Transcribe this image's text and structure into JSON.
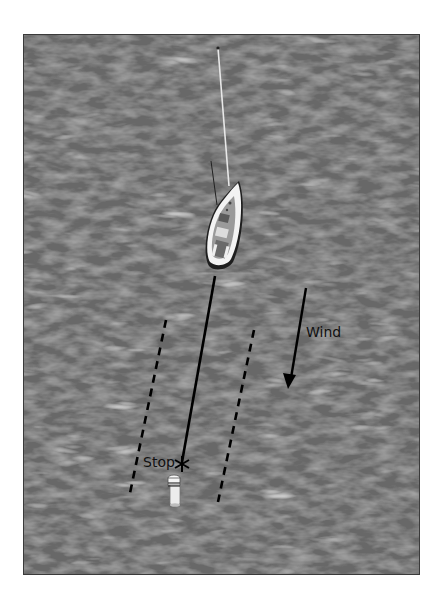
{
  "diagram": {
    "type": "sailing-maneuver",
    "background": {
      "color": "#6b6b6b",
      "texture": "water"
    },
    "labels": {
      "wind": "Wind",
      "stop": "Stop"
    },
    "elements": {
      "boat": {
        "description": "sailboat seen from above, bow pointing up",
        "hull_color": "#f2f2f2"
      },
      "mast": {
        "color": "#e6e6e6"
      },
      "course_line": {
        "style": "solid",
        "color": "#000000"
      },
      "boundary_lines": {
        "style": "dashed",
        "color": "#000000",
        "count": 2
      },
      "wind_arrow": {
        "direction": "down-left",
        "color": "#000000"
      },
      "stop_marker": {
        "glyph": "asterisk",
        "color": "#000000"
      },
      "buoy": {
        "color": "#eeeeee"
      }
    },
    "colors": {
      "water_dark": "#5a5a5a",
      "water_mid": "#707070",
      "water_light": "#a8a8a8",
      "border": "#333333",
      "ink": "#000000"
    }
  }
}
